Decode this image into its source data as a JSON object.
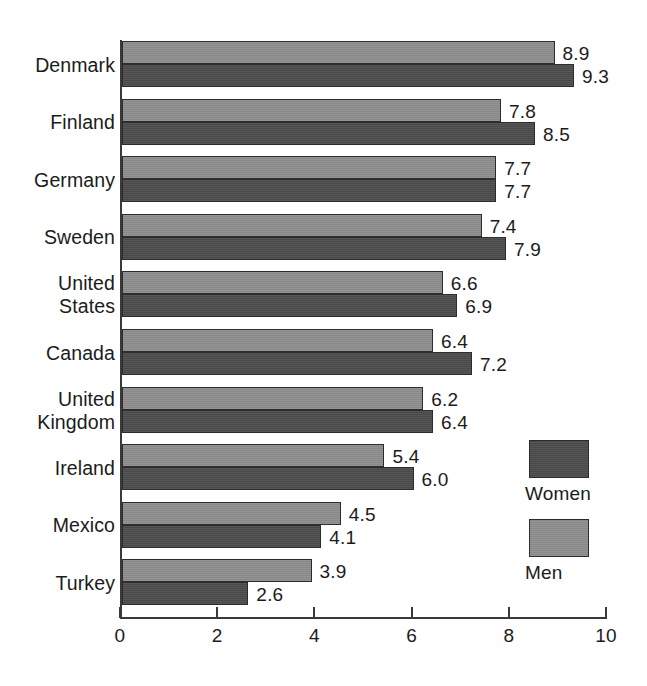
{
  "chart_data": {
    "type": "bar",
    "orientation": "horizontal",
    "title": "",
    "xlabel": "",
    "ylabel": "",
    "xlim": [
      0,
      10
    ],
    "xticks": [
      "0",
      "2",
      "4",
      "6",
      "8",
      "10"
    ],
    "grid": false,
    "legend_position": "right-lower",
    "categories": [
      "Denmark",
      "Finland",
      "Germany",
      "Sweden",
      "United\nStates",
      "Canada",
      "United\nKingdom",
      "Ireland",
      "Mexico",
      "Turkey"
    ],
    "series": [
      {
        "name": "Men",
        "color": "#8e8e8e",
        "values": [
          8.9,
          7.8,
          7.7,
          7.4,
          6.6,
          6.4,
          6.2,
          5.4,
          4.5,
          3.9
        ],
        "labels": [
          "8.9",
          "7.8",
          "7.7",
          "7.4",
          "6.6",
          "6.4",
          "6.2",
          "5.4",
          "4.5",
          "3.9"
        ]
      },
      {
        "name": "Women",
        "color": "#4c4c4c",
        "values": [
          9.3,
          8.5,
          7.7,
          7.9,
          6.9,
          7.2,
          6.4,
          6.0,
          4.1,
          2.6
        ],
        "labels": [
          "9.3",
          "8.5",
          "7.7",
          "7.9",
          "6.9",
          "7.2",
          "6.4",
          "6.0",
          "4.1",
          "2.6"
        ]
      }
    ]
  },
  "legend": {
    "items": [
      {
        "label": "Women",
        "swatch": "dark-gray-swatch"
      },
      {
        "label": "Men",
        "swatch": "light-gray-swatch"
      }
    ]
  }
}
